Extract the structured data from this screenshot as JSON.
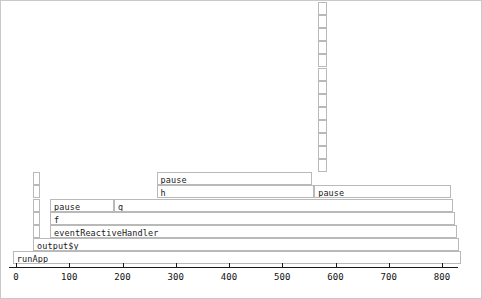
{
  "chart_data": {
    "type": "bar",
    "subtype": "flamegraph",
    "title": "",
    "xlabel": "",
    "ylabel": "",
    "grid": false,
    "legend": null,
    "xlim": [
      0,
      840
    ],
    "axis": {
      "ticks": [
        0,
        100,
        200,
        300,
        400,
        500,
        600,
        700,
        800
      ],
      "tick_labels": [
        "0",
        "100",
        "200",
        "300",
        "400",
        "500",
        "600",
        "700",
        "800"
      ]
    },
    "depth_levels": 18,
    "frames": [
      {
        "label": "runApp",
        "depth": 0,
        "x_start": -6,
        "x_end": 836,
        "value": 842
      },
      {
        "label": "output$y",
        "depth": 1,
        "x_start": 32,
        "x_end": 832,
        "value": 800
      },
      {
        "label": "eventReactiveHandler",
        "depth": 2,
        "x_start": 64,
        "x_end": 828,
        "value": 764
      },
      {
        "label": "f",
        "depth": 3,
        "x_start": 64,
        "x_end": 824,
        "value": 760
      },
      {
        "label": "pause",
        "depth": 4,
        "x_start": 64,
        "x_end": 184,
        "value": 120
      },
      {
        "label": "g",
        "depth": 4,
        "x_start": 184,
        "x_end": 820,
        "value": 636
      },
      {
        "label": "h",
        "depth": 5,
        "x_start": 264,
        "x_end": 560,
        "value": 296
      },
      {
        "label": "pause",
        "depth": 5,
        "x_start": 560,
        "x_end": 816,
        "value": 256
      },
      {
        "label": "pause",
        "depth": 6,
        "x_start": 264,
        "x_end": 556,
        "value": 292
      },
      {
        "label": "",
        "depth": 7,
        "x_start": 568,
        "x_end": 584,
        "value": 16
      },
      {
        "label": "",
        "depth": 8,
        "x_start": 568,
        "x_end": 584,
        "value": 16
      },
      {
        "label": "",
        "depth": 9,
        "x_start": 568,
        "x_end": 584,
        "value": 16
      },
      {
        "label": "",
        "depth": 10,
        "x_start": 568,
        "x_end": 584,
        "value": 16
      },
      {
        "label": "",
        "depth": 11,
        "x_start": 568,
        "x_end": 584,
        "value": 16
      },
      {
        "label": "",
        "depth": 12,
        "x_start": 568,
        "x_end": 584,
        "value": 16
      },
      {
        "label": "",
        "depth": 13,
        "x_start": 568,
        "x_end": 584,
        "value": 16
      },
      {
        "label": "",
        "depth": 14,
        "x_start": 568,
        "x_end": 584,
        "value": 16
      },
      {
        "label": "",
        "depth": 15,
        "x_start": 568,
        "x_end": 584,
        "value": 16
      },
      {
        "label": "",
        "depth": 16,
        "x_start": 568,
        "x_end": 584,
        "value": 16
      },
      {
        "label": "",
        "depth": 17,
        "x_start": 568,
        "x_end": 584,
        "value": 16
      },
      {
        "label": "",
        "depth": 18,
        "x_start": 568,
        "x_end": 584,
        "value": 16
      },
      {
        "label": "",
        "depth": 19,
        "x_start": 568,
        "x_end": 584,
        "value": 16
      },
      {
        "label": "",
        "depth": 2,
        "x_start": 32,
        "x_end": 46,
        "value": 14
      },
      {
        "label": "",
        "depth": 3,
        "x_start": 32,
        "x_end": 46,
        "value": 14
      },
      {
        "label": "",
        "depth": 4,
        "x_start": 32,
        "x_end": 46,
        "value": 14
      },
      {
        "label": "",
        "depth": 5,
        "x_start": 32,
        "x_end": 46,
        "value": 14
      },
      {
        "label": "",
        "depth": 6,
        "x_start": 32,
        "x_end": 46,
        "value": 14
      }
    ]
  },
  "style": {
    "block_fill": "#ffffff",
    "block_stroke": "#b9b9b9",
    "axis_color": "#1b1b1b",
    "frame_color": "#c9c9c9",
    "text_color": "#1a1a1a"
  }
}
